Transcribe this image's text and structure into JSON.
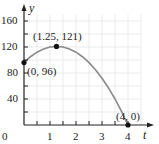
{
  "chart_data": {
    "type": "line",
    "title": "",
    "xlabel": "t",
    "ylabel": "y",
    "xlim": [
      0,
      4.3
    ],
    "ylim": [
      0,
      170
    ],
    "x_ticks": [
      "0",
      "1",
      "2",
      "3",
      "4"
    ],
    "y_ticks": [
      "40",
      "80",
      "120",
      "160"
    ],
    "grid": true,
    "legend": null,
    "series": [
      {
        "name": "y = -16t^2 + 40t + 96",
        "x": [
          0,
          0.25,
          0.5,
          0.75,
          1,
          1.25,
          1.5,
          1.75,
          2,
          2.25,
          2.5,
          2.75,
          3,
          3.25,
          3.5,
          3.75,
          4
        ],
        "values": [
          96,
          105,
          112,
          117,
          120,
          121,
          120,
          117,
          112,
          105,
          96,
          85,
          72,
          57,
          40,
          21,
          0
        ],
        "color": "#8a8a8a"
      }
    ],
    "annotations": [
      {
        "label": "(0, 96)",
        "x": 0,
        "y": 96
      },
      {
        "label": "(1.25, 121)",
        "x": 1.25,
        "y": 121
      },
      {
        "label": "(4, 0)",
        "x": 4,
        "y": 0
      }
    ]
  },
  "labels": {
    "x_axis": "t",
    "y_axis": "y",
    "origin": "0",
    "x1": "1",
    "x2": "2",
    "x3": "3",
    "x4": "4",
    "y40": "40",
    "y80": "80",
    "y120": "120",
    "y160": "160",
    "p0": "(0, 96)",
    "p1": "(1.25, 121)",
    "p2": "(4, 0)"
  }
}
